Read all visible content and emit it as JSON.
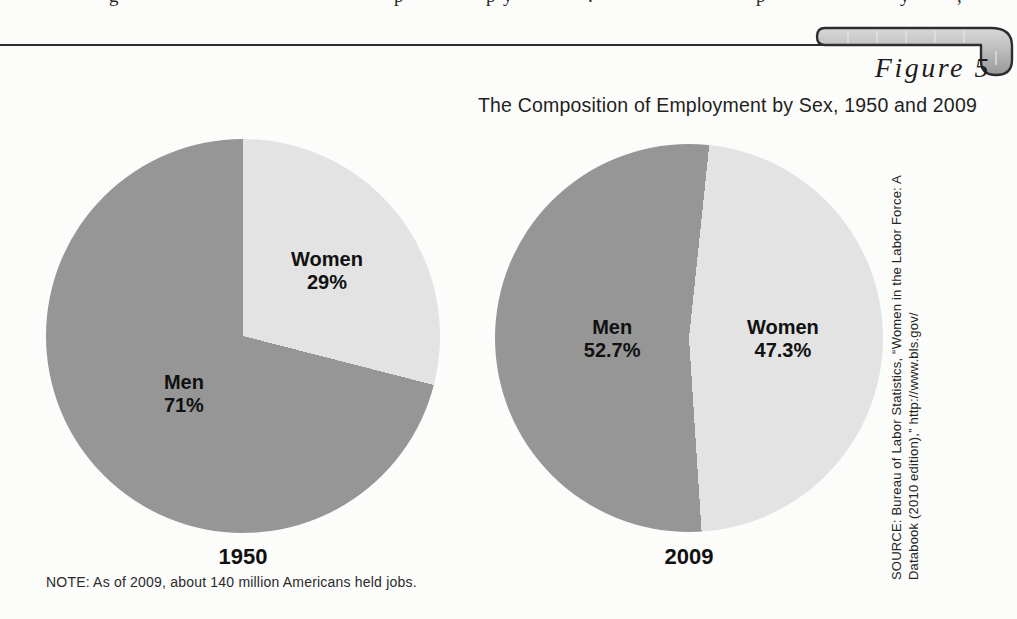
{
  "page": {
    "figure_label": "Figure 5",
    "title": "The Composition of Employment by Sex, 1950 and 2009",
    "note": "NOTE: As of 2009, about 140 million Americans held jobs.",
    "source_line1": "SOURCE: Bureau of Labor Statistics, “Women in the Labor Force: A",
    "source_line2": "Databook (2010 edition),” http://www.bls.gov/"
  },
  "colors": {
    "men": "#969696",
    "women": "#e3e3e3",
    "text": "#1d1d1d",
    "rule": "#2d2d2d",
    "background": "#fcfcfa"
  },
  "chart_data": [
    {
      "type": "pie",
      "year_label": "1950",
      "start_angle_deg": 0,
      "slices": [
        {
          "label": "Women",
          "value": 29,
          "display": "29%",
          "color": "women"
        },
        {
          "label": "Men",
          "value": 71,
          "display": "71%",
          "color": "men"
        }
      ]
    },
    {
      "type": "pie",
      "year_label": "2009",
      "start_angle_deg": 6,
      "slices": [
        {
          "label": "Women",
          "value": 47.3,
          "display": "47.3%",
          "color": "women"
        },
        {
          "label": "Men",
          "value": 52.7,
          "display": "52.7%",
          "color": "men"
        }
      ]
    }
  ],
  "top_fragments": [
    {
      "glyph": "g",
      "x": 109
    },
    {
      "glyph": "p",
      "x": 394
    },
    {
      "glyph": "p",
      "x": 486
    },
    {
      "glyph": "y",
      "x": 503
    },
    {
      "glyph": ".",
      "x": 588
    },
    {
      "glyph": "p",
      "x": 756
    },
    {
      "glyph": "y",
      "x": 900
    },
    {
      "glyph": ",",
      "x": 957
    }
  ]
}
